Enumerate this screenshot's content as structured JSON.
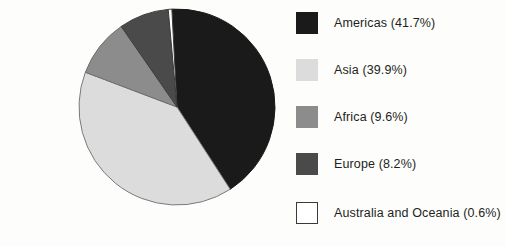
{
  "chart_data": {
    "type": "pie",
    "title": "",
    "subtitle": "",
    "xlabel": "",
    "ylabel": "",
    "legend_position": "right",
    "grid": false,
    "start_angle_deg": -3,
    "direction": "clockwise",
    "categories": [
      "Americas",
      "Asia",
      "Africa",
      "Europe",
      "Australia and Oceania"
    ],
    "values": [
      41.7,
      39.9,
      9.6,
      8.2,
      0.6
    ],
    "units": "percent",
    "slices": [
      {
        "label": "Americas",
        "value": 41.7,
        "value_text": "41.7%",
        "legend_text": "Americas (41.7%)",
        "color": "#1a1a1a",
        "stroke": "#1a1a1a"
      },
      {
        "label": "Asia",
        "value": 39.9,
        "value_text": "39.9%",
        "legend_text": "Asia (39.9%)",
        "color": "#dcdcdc",
        "stroke": "#7a7a7a"
      },
      {
        "label": "Africa",
        "value": 9.6,
        "value_text": "9.6%",
        "legend_text": "Africa (9.6%)",
        "color": "#8c8c8c",
        "stroke": "#6e6e6e"
      },
      {
        "label": "Europe",
        "value": 8.2,
        "value_text": "8.2%",
        "legend_text": "Europe (8.2%)",
        "color": "#4a4a4a",
        "stroke": "#3d3d3d"
      },
      {
        "label": "Australia and Oceania",
        "value": 0.6,
        "value_text": "0.6%",
        "legend_text": "Australia and Oceania (0.6%)",
        "color": "#ffffff",
        "stroke": "#3a3a3a"
      }
    ]
  },
  "legend": {
    "items": [
      {
        "label": "Americas (41.7%)",
        "color": "#1a1a1a",
        "border": "#1a1a1a"
      },
      {
        "label": "Asia (39.9%)",
        "color": "#dcdcdc",
        "border": "#dcdcdc"
      },
      {
        "label": "Africa (9.6%)",
        "color": "#8c8c8c",
        "border": "#8c8c8c"
      },
      {
        "label": "Europe (8.2%)",
        "color": "#4a4a4a",
        "border": "#4a4a4a"
      },
      {
        "label": "Australia and Oceania (0.6%)",
        "color": "#ffffff",
        "border": "#3a3a3a"
      }
    ]
  }
}
